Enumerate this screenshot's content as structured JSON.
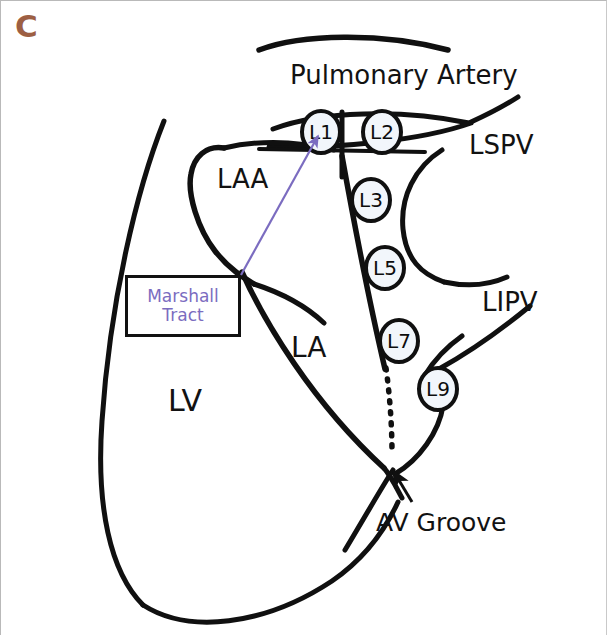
{
  "figure": {
    "panel_letter": "C",
    "panel_letter_color": "#9d5f43",
    "background_color": "#ffffff",
    "stroke_color": "#101010",
    "accent_color": "#7b6cc0",
    "node_fill_color": "#f2f6fb",
    "width": 607,
    "height": 635
  },
  "labels": [
    {
      "id": "pulmonary-artery",
      "text": "Pulmonary Artery",
      "x": 289,
      "y": 61,
      "size": 26
    },
    {
      "id": "lspv",
      "text": "LSPV",
      "x": 468,
      "y": 131,
      "size": 26
    },
    {
      "id": "laa",
      "text": "LAA",
      "x": 216,
      "y": 165,
      "size": 26
    },
    {
      "id": "lipv",
      "text": "LIPV",
      "x": 481,
      "y": 288,
      "size": 26
    },
    {
      "id": "la",
      "text": "LA",
      "x": 290,
      "y": 333,
      "size": 28
    },
    {
      "id": "lv",
      "text": "LV",
      "x": 167,
      "y": 385,
      "size": 30
    },
    {
      "id": "av-groove",
      "text": "AV Groove",
      "x": 375,
      "y": 509,
      "size": 25
    }
  ],
  "callout": {
    "id": "marshall-tract",
    "lines": [
      "Marshall",
      "Tract"
    ],
    "text_color": "#7b6cc0",
    "border_color": "#111111",
    "x": 124,
    "y": 274,
    "width": 116,
    "height": 62,
    "font_size": 17
  },
  "nodes": [
    {
      "id": "l1",
      "label": "L1",
      "cx": 320,
      "cy": 131,
      "rx": 19,
      "ry": 21
    },
    {
      "id": "l2",
      "label": "L2",
      "cx": 381,
      "cy": 131,
      "rx": 19,
      "ry": 21
    },
    {
      "id": "l3",
      "label": "L3",
      "cx": 370,
      "cy": 199,
      "rx": 19,
      "ry": 21
    },
    {
      "id": "l5",
      "label": "L5",
      "cx": 384,
      "cy": 267,
      "rx": 19,
      "ry": 21
    },
    {
      "id": "l7",
      "label": "L7",
      "cx": 398,
      "cy": 340,
      "rx": 19,
      "ry": 21
    },
    {
      "id": "l9",
      "label": "L9",
      "cx": 437,
      "cy": 388,
      "rx": 19,
      "ry": 21
    }
  ],
  "arrows": {
    "marshall_tract_pointer": {
      "id": "marshall-tract-arrow",
      "from_x": 240,
      "from_y": 274,
      "to_x": 318,
      "to_y": 134,
      "color": "#7b6cc0"
    },
    "av_groove_pointer": {
      "id": "av-groove-arrow",
      "from_x": 410,
      "from_y": 500,
      "to_x": 392,
      "to_y": 470,
      "color": "#101010"
    }
  },
  "strokes": {
    "pulmonary_artery_arc": "M 258,49 C 300,33 380,31 447,49",
    "pa_band_top": "M 272,128 C 320,110 400,108 468,122",
    "pa_band_bottom": "M 268,146 C 330,148 420,140 470,122",
    "pa_band_base": "M 258,147 L 420,150",
    "lspv_stem": "M 470,121 C 490,112 503,105 516,97",
    "septum_vertical": "M 341,112 L 341,175",
    "lspv_vein": "M 439,150 C 413,167 399,196 402,228 C 405,258 420,273 443,281",
    "lipv_vein": "M 443,281 C 466,285 487,283 504,276",
    "laa_outline": "M 222,147 C 205,145 194,155 190,172 C 186,192 196,227 213,249 C 228,268 243,277 252,283",
    "laa_top": "M 222,147 C 262,139 300,141 331,148",
    "laa_lower_right": "M 252,283 C 280,292 305,305 322,321",
    "la_left_wall": "M 241,272 C 262,320 310,400 382,466",
    "la_right_wall": "M 331,150 C 346,220 360,300 372,352",
    "ridge_line": "M 341,152 C 352,215 368,300 383,368",
    "lv_left": "M 162,122 C 135,188 108,300 100,420 C 94,505 108,570 141,604",
    "lv_bottom": "M 141,604 C 186,632 262,625 330,580 C 365,556 384,528 396,502",
    "av_cross_left": "M 345,548 C 362,520 380,488 392,468",
    "lv_to_groove": "M 382,466 C 389,474 394,485 400,496",
    "l9_lower": "M 441,404 C 437,430 418,458 394,472",
    "l9_upper": "M 425,373 C 432,360 444,346 460,334",
    "lipv_stem": "M 437,368 C 466,352 500,328 527,306"
  },
  "dotted_path": {
    "id": "marshall-vein-dotted",
    "path": "M 384,366 C 388,395 390,425 390,452",
    "dash": "2 9"
  }
}
